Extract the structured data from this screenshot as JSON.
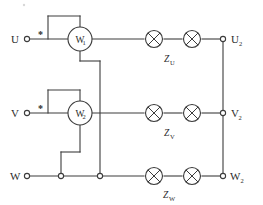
{
  "diagram": {
    "background_color": "#ffffff",
    "line_color": "#3c3c3c"
  },
  "input_terminals": [
    {
      "label": "U",
      "line": "top"
    },
    {
      "label": "V",
      "line": "middle"
    },
    {
      "label": "W",
      "line": "bottom"
    }
  ],
  "output_terminals": [
    {
      "label": "U",
      "sub": "2",
      "line": "top"
    },
    {
      "label": "V",
      "sub": "2",
      "line": "middle"
    },
    {
      "label": "W",
      "sub": "2",
      "line": "bottom"
    }
  ],
  "wattmeters": [
    {
      "label": "W",
      "sub": "1",
      "line": "top",
      "polarity_mark": "*"
    },
    {
      "label": "W",
      "sub": "2",
      "line": "middle",
      "polarity_mark": "*"
    }
  ],
  "impedances": [
    {
      "label": "Z",
      "sub": "U",
      "line": "top",
      "element_count": 2
    },
    {
      "label": "Z",
      "sub": "V",
      "line": "middle",
      "element_count": 2
    },
    {
      "label": "Z",
      "sub": "W",
      "line": "bottom",
      "element_count": 2
    }
  ],
  "junction_nodes": [
    {
      "name": "w2-voltage-coil-return",
      "line": "bottom"
    },
    {
      "name": "w1-voltage-coil-return",
      "line": "bottom"
    }
  ],
  "icons": {
    "load": "crossed-circle-icon",
    "meter": "circle-meter-icon",
    "terminal": "open-circle-terminal-icon"
  }
}
